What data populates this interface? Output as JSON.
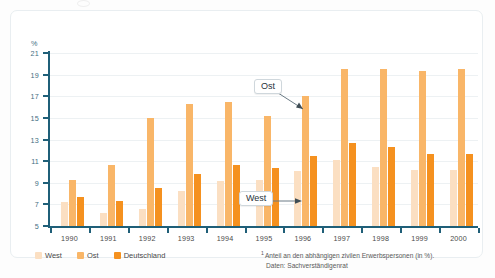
{
  "chart_data": {
    "type": "bar",
    "title": "",
    "xlabel": "",
    "ylabel": "%",
    "ylim": [
      5,
      21
    ],
    "ytick_step": 2,
    "grid": true,
    "legend_position": "bottom-left",
    "categories": [
      "1990",
      "1991",
      "1992",
      "1993",
      "1994",
      "1995",
      "1996",
      "1997",
      "1998",
      "1999",
      "2000"
    ],
    "series": [
      {
        "name": "West",
        "color": "#fbdfc2",
        "values": [
          7.2,
          6.2,
          6.6,
          8.2,
          9.2,
          9.3,
          10.1,
          11.1,
          10.5,
          10.2,
          10.2
        ]
      },
      {
        "name": "Ost",
        "color": "#f9b668",
        "values": [
          9.3,
          10.6,
          15.0,
          16.3,
          16.5,
          15.2,
          17.0,
          19.5,
          19.5,
          19.3,
          19.5
        ]
      },
      {
        "name": "Deutschland",
        "color": "#f5911f",
        "values": [
          7.7,
          7.3,
          8.5,
          9.8,
          10.6,
          10.4,
          11.5,
          12.7,
          12.3,
          11.7,
          11.7
        ]
      }
    ],
    "annotations": [
      {
        "label": "Ost",
        "target_category": "1996",
        "target_series": "Ost",
        "arrow": "down-right"
      },
      {
        "label": "West",
        "target_category": "1996",
        "target_series": "West",
        "arrow": "right"
      }
    ]
  },
  "axis": {
    "y_unit": "%",
    "y_ticks": [
      "21",
      "19",
      "17",
      "15",
      "13",
      "11",
      "9",
      "7",
      "5"
    ],
    "x_ticks": [
      "1990",
      "1991",
      "1992",
      "1993",
      "1994",
      "1995",
      "1996",
      "1997",
      "1998",
      "1999",
      "2000"
    ]
  },
  "legend": {
    "items": [
      {
        "label": "West",
        "color": "#fbdfc2"
      },
      {
        "label": "Ost",
        "color": "#f9b668"
      },
      {
        "label": "Deutschland",
        "color": "#f5911f"
      }
    ]
  },
  "callouts": {
    "ost": "Ost",
    "west": "West"
  },
  "footnote": {
    "marker": "1",
    "line1": "Anteil an den abhängigen zivilen Erwerbspersonen (in %).",
    "line2": "Daten: Sachverständigenrat"
  }
}
